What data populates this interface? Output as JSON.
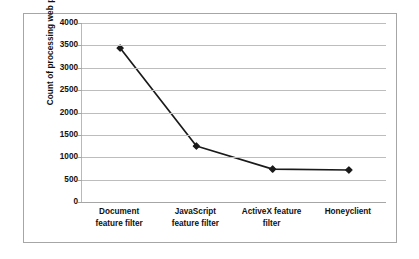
{
  "chart_data": {
    "type": "line",
    "title": "",
    "xlabel": "",
    "ylabel": "Count of processing web pages",
    "categories": [
      "Document feature filter",
      "JavaScript feature filter",
      "ActiveX feature filter",
      "Honeyclient"
    ],
    "category_lines": [
      [
        "Document",
        "feature filter"
      ],
      [
        "JavaScript",
        "feature filter"
      ],
      [
        "ActiveX feature",
        "filter"
      ],
      [
        "Honeyclient"
      ]
    ],
    "values": [
      3440,
      1250,
      735,
      715
    ],
    "ylim": [
      0,
      4000
    ],
    "ytick_step": 500,
    "yticks": [
      0,
      500,
      1000,
      1500,
      2000,
      2500,
      3000,
      3500,
      4000
    ],
    "ytick_labels": [
      "0",
      "500",
      "1000",
      "1500",
      "2000",
      "2500",
      "3000",
      "3500",
      "4000"
    ],
    "grid": true,
    "grid_axis": "y",
    "legend": false,
    "legend_position": "none",
    "marker": "diamond",
    "series": [
      {
        "name": "Count of processing web pages",
        "values": [
          3440,
          1250,
          735,
          715
        ]
      }
    ]
  },
  "style": {
    "line_color": "#1a1a1a",
    "marker_color": "#1a1a1a",
    "gridline_color": "#bdbdbd",
    "axis_color": "#a6a6a6",
    "frame_color": "#a6a6a6",
    "background": "#ffffff",
    "text_color": "#111111"
  }
}
